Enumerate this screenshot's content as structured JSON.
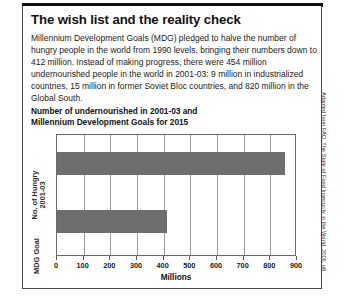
{
  "headline": "The wish list and the reality check",
  "body_copy": "Millennium Development Goals (MDG) pledged to halve the number of hungry people in the world from 1990 levels, bringing their numbers down to 412 million. Instead of making progress, there were 454 million undernourished people in the world in 2001-03: 9 million in industrialized countries, 15 million in former Soviet Bloc countries, and 820 million in the Global South.",
  "credit": "Adapted from FAO, The State of Food Insecurity in the World, 2006, p8.",
  "colors": {
    "bar": "#6e6e6e",
    "frame": "#6a6a6a",
    "grid": "#9a9a9a",
    "rule": "#111111"
  },
  "chart_data": {
    "type": "bar",
    "orientation": "horizontal",
    "title": "Number of undernourished in 2001-03 and Millennium Development Goals for 2015",
    "title_line1": "Number of undernourished in 2001-03 and",
    "title_line2": "Millennium Development Goals for 2015",
    "categories": [
      "No. of Hungry\n2001-03",
      "MDG Goal"
    ],
    "values": [
      854,
      412
    ],
    "xlabel": "Millions",
    "ylabel": "",
    "xlim": [
      0,
      900
    ],
    "xticks": [
      0,
      100,
      200,
      300,
      400,
      500,
      600,
      700,
      800,
      900
    ],
    "xticklabels": [
      "0",
      "100",
      "200",
      "300",
      "400",
      "500",
      "600",
      "700",
      "800",
      "900"
    ],
    "grid": true,
    "legend": false
  }
}
